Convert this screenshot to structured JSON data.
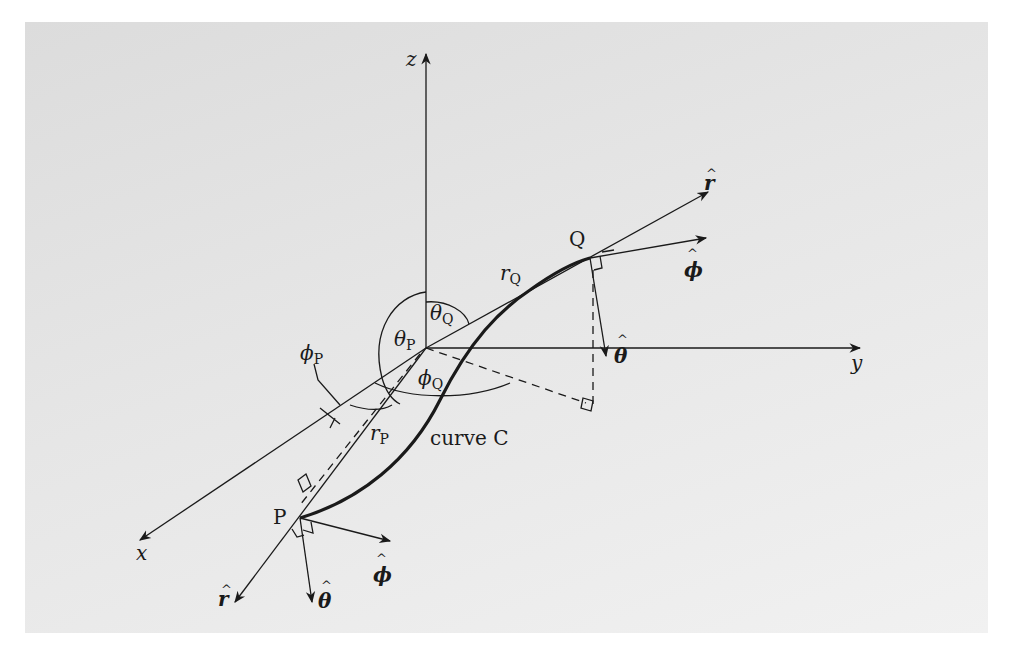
{
  "diagram": {
    "axes": {
      "x": "x",
      "y": "y",
      "z": "z"
    },
    "points": {
      "P": "P",
      "Q": "Q"
    },
    "curve_label": "curve C",
    "radii": {
      "rP_main": "r",
      "rP_sub": "P",
      "rQ_main": "r",
      "rQ_sub": "Q"
    },
    "angles": {
      "thetaP_main": "θ",
      "thetaP_sub": "P",
      "thetaQ_main": "θ",
      "thetaQ_sub": "Q",
      "phiP_main": "ϕ",
      "phiP_sub": "P",
      "phiQ_main": "ϕ",
      "phiQ_sub": "Q"
    },
    "unit_vectors_Q": {
      "r_hat": "r",
      "phi_hat": "ϕ",
      "theta_hat": "θ"
    },
    "unit_vectors_P": {
      "r_hat": "r",
      "phi_hat": "ϕ",
      "theta_hat": "θ"
    },
    "hat_glyph": "^",
    "colors": {
      "background": "#e4e4e4",
      "ink": "#1a1a1a"
    }
  }
}
